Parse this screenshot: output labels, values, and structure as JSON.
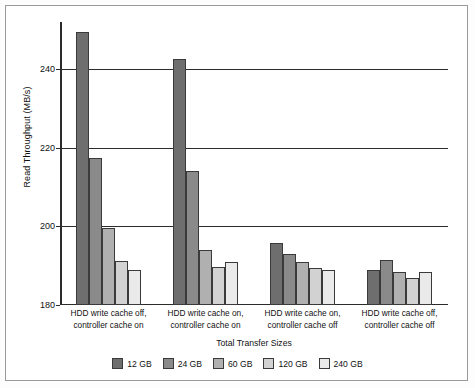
{
  "chart_data": {
    "type": "bar",
    "title": "",
    "xlabel": "Total Transfer Sizes",
    "ylabel": "Read Throughput (MB/s)",
    "ylim": [
      180,
      252
    ],
    "yticks": [
      180,
      200,
      220,
      240
    ],
    "ytick_labels": [
      "180",
      "200",
      "220",
      "240"
    ],
    "grid": true,
    "legend_position": "bottom",
    "categories": [
      "HDD write cache off, controller cache on",
      "HDD write cache on, controller cache on",
      "HDD write cache on, controller cache off",
      "HDD write cache off, controller cache off"
    ],
    "category_lines": [
      [
        "HDD write cache off,",
        "controller cache on"
      ],
      [
        "HDD write cache on,",
        "controller cache on"
      ],
      [
        "HDD write cache on,",
        "controller cache off"
      ],
      [
        "HDD write cache off,",
        "controller cache off"
      ]
    ],
    "series": [
      {
        "name": "12 GB",
        "color": "#6e6e6e",
        "values": [
          249.5,
          242.7,
          195.8,
          189.0
        ]
      },
      {
        "name": "24 GB",
        "color": "#8a8a8a",
        "values": [
          217.3,
          214.2,
          193.0,
          191.5
        ]
      },
      {
        "name": "60 GB",
        "color": "#b0b0b0",
        "values": [
          199.5,
          194.0,
          191.0,
          188.4
        ]
      },
      {
        "name": "120 GB",
        "color": "#d2d2d2",
        "values": [
          191.3,
          189.7,
          189.5,
          187.0
        ]
      },
      {
        "name": "240 GB",
        "color": "#eaeaea",
        "values": [
          189.0,
          190.9,
          188.9,
          188.5
        ]
      }
    ]
  },
  "legend": {
    "items": [
      {
        "label": "12 GB",
        "color": "#6e6e6e"
      },
      {
        "label": "24 GB",
        "color": "#8a8a8a"
      },
      {
        "label": "60 GB",
        "color": "#b0b0b0"
      },
      {
        "label": "120 GB",
        "color": "#d2d2d2"
      },
      {
        "label": "240 GB",
        "color": "#eaeaea"
      }
    ]
  },
  "axes": {
    "y_title": "Read Throughput (MB/s)",
    "x_title": "Total Transfer Sizes"
  }
}
